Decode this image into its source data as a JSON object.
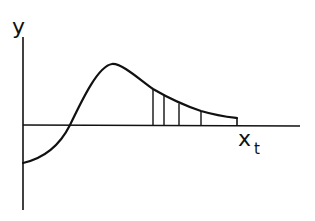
{
  "diagram": {
    "y_axis_label": "y",
    "x_axis_label": "x",
    "x_axis_subscript": "t",
    "stroke_color": "#111111",
    "background": "#ffffff",
    "curve_points": [
      [
        23,
        163
      ],
      [
        40,
        158
      ],
      [
        55,
        147
      ],
      [
        65,
        132
      ],
      [
        70,
        125
      ],
      [
        80,
        102
      ],
      [
        95,
        78
      ],
      [
        105,
        67
      ],
      [
        112,
        64
      ],
      [
        120,
        67
      ],
      [
        153,
        90
      ],
      [
        164,
        96
      ],
      [
        179,
        104
      ],
      [
        201,
        112
      ],
      [
        225,
        117
      ],
      [
        237,
        118
      ]
    ],
    "vertical_lines_x": [
      153,
      164,
      179,
      201,
      237
    ],
    "axis_origin": [
      23,
      125
    ],
    "x_axis_end": 300,
    "y_axis_top": 37,
    "y_axis_bottom": 210
  }
}
